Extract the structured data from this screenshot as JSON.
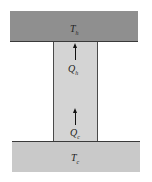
{
  "diagram": {
    "hot_reservoir": {
      "symbol": "T",
      "subscript": "h"
    },
    "cold_reservoir": {
      "symbol": "T",
      "subscript": "c"
    },
    "heat_flows": [
      {
        "symbol": "Q",
        "subscript": "h",
        "direction": "up"
      },
      {
        "symbol": "Q",
        "subscript": "c",
        "direction": "up"
      }
    ]
  },
  "colors": {
    "hot": "#8f8f8f",
    "column": "#d4d4d4",
    "cold": "#c9c9c9"
  }
}
